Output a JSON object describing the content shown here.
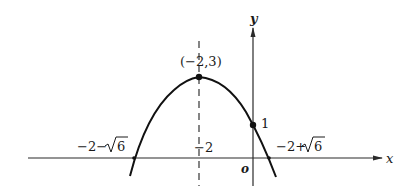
{
  "diagram": {
    "type": "parabola-graph",
    "axes": {
      "x_label": "x",
      "y_label": "y",
      "origin_label": "o"
    },
    "vertex": {
      "label": "(−2,3)",
      "x": -2,
      "y": 3
    },
    "y_intercept": {
      "label": "1",
      "x": 0,
      "y": 1
    },
    "axis_of_symmetry": {
      "label": "−2",
      "x": -2,
      "style": "dashed"
    },
    "roots": [
      {
        "label_prefix": "−2−",
        "label_radical": "6",
        "value": "-2-√6"
      },
      {
        "label_prefix": "−2+",
        "label_radical": "6",
        "value": "-2+√6"
      }
    ],
    "colors": {
      "line": "#111111",
      "background": "#ffffff"
    }
  }
}
